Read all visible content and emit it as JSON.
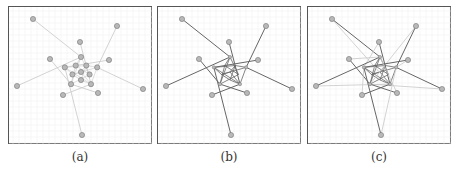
{
  "figure": {
    "panels": [
      {
        "id": "a",
        "caption": "(a)",
        "style": "light",
        "description": "Graph layout with light grey edges; nodes clustered around center with radial outliers"
      },
      {
        "id": "b",
        "caption": "(b)",
        "style": "dark",
        "description": "Same graph with dark edges; outer nodes connected to a dense central pentagonal core"
      },
      {
        "id": "c",
        "caption": "(c)",
        "style": "mixed",
        "description": "Same graph with both dark and light edges overlaid forming a star pattern"
      }
    ],
    "colors": {
      "node_fill": "#b8b8b8",
      "node_stroke": "#777777",
      "edge_light": "#c8c8c8",
      "edge_dark": "#666666",
      "grid": "#eeeeee",
      "frame": "#555555"
    }
  }
}
